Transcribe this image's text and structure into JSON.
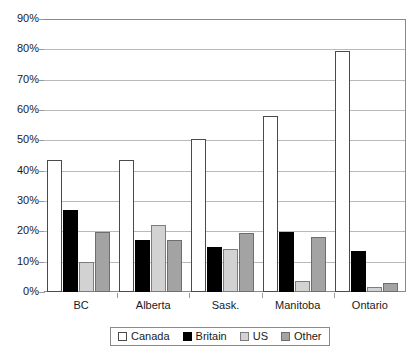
{
  "chart_data": {
    "type": "bar",
    "title": "",
    "subtitle": "",
    "xlabel": "",
    "ylabel": "",
    "categories": [
      "BC",
      "Alberta",
      "Sask.",
      "Manitoba",
      "Ontario"
    ],
    "series": [
      {
        "name": "Canada",
        "color": "#ffffff",
        "values": [
          43.5,
          43.5,
          50.5,
          58.0,
          79.5
        ]
      },
      {
        "name": "Britain",
        "color": "#000000",
        "values": [
          27.0,
          17.0,
          15.0,
          19.8,
          13.5
        ]
      },
      {
        "name": "US",
        "color": "#d2d2d2",
        "values": [
          9.8,
          22.0,
          14.2,
          3.5,
          1.5
        ]
      },
      {
        "name": "Other",
        "color": "#a3a3a3",
        "values": [
          19.8,
          17.0,
          19.5,
          18.0,
          3.0
        ]
      }
    ],
    "ylim": [
      0,
      90
    ],
    "ytick_values": [
      0,
      10,
      20,
      30,
      40,
      50,
      60,
      70,
      80,
      90
    ],
    "ytick_labels": [
      "0%",
      "10%",
      "20%",
      "30%",
      "40%",
      "50%",
      "60%",
      "70%",
      "80%",
      "90%"
    ],
    "grid": true,
    "legend_position": "bottom",
    "legend_entries": [
      "Canada",
      "Britain",
      "US",
      "Other"
    ]
  }
}
